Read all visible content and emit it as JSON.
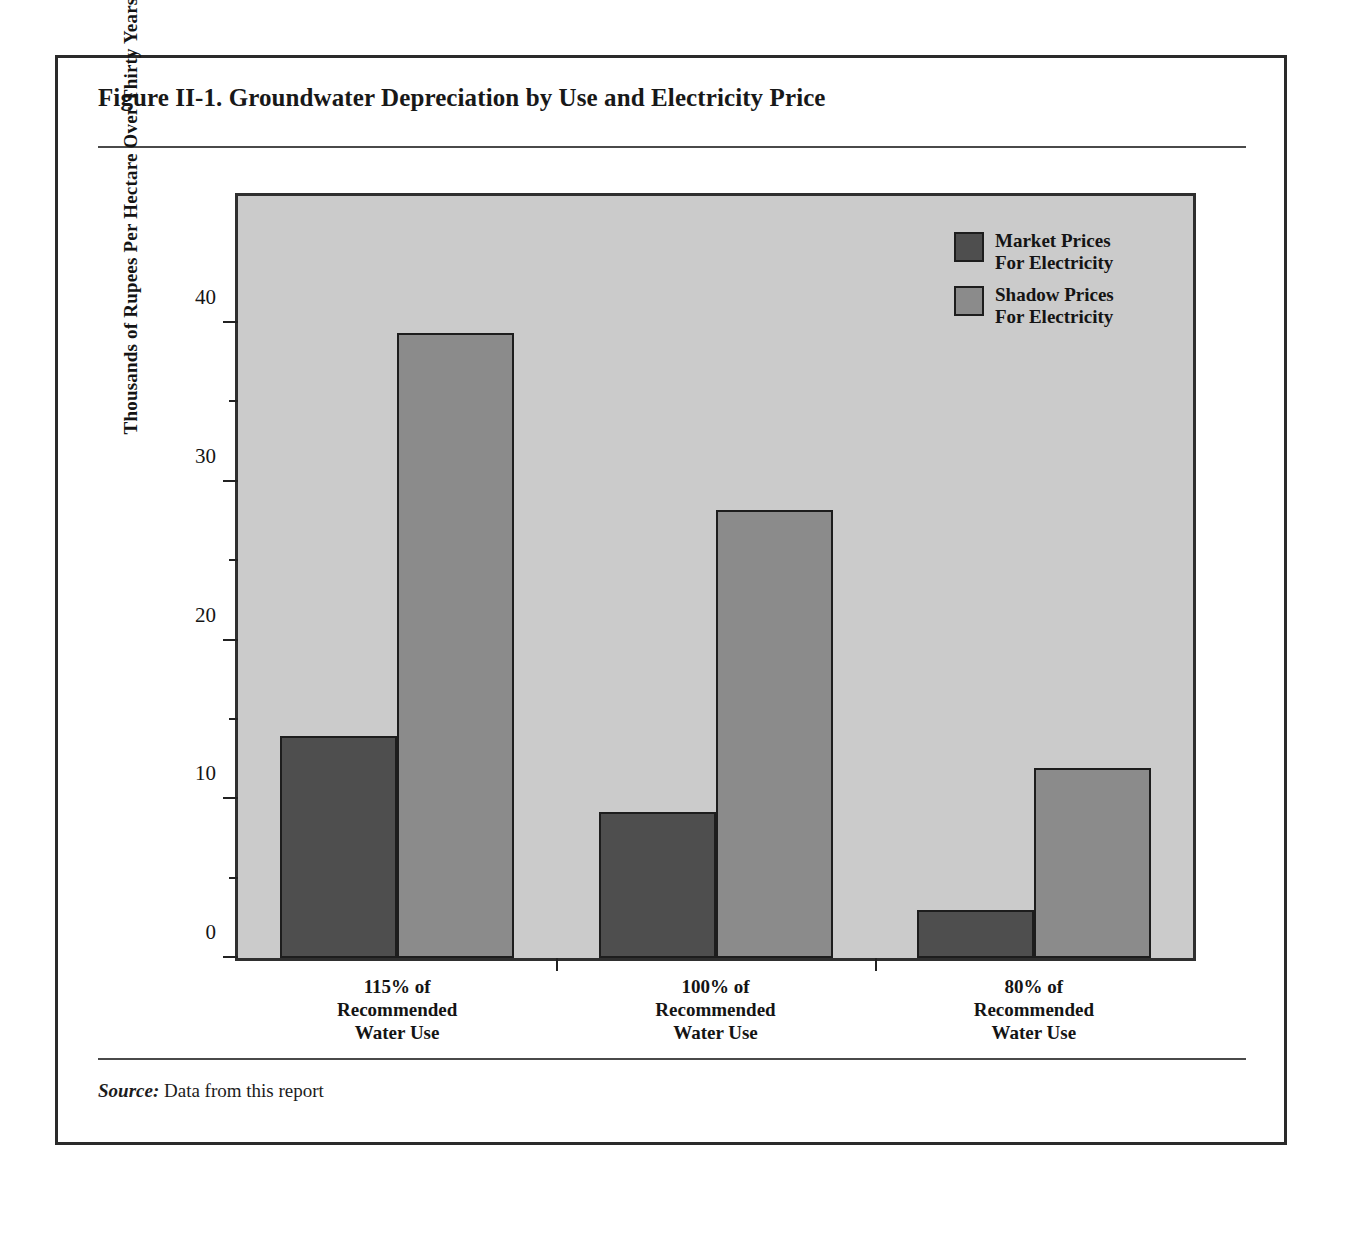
{
  "figure": {
    "title": "Figure II-1.  Groundwater Depreciation by Use and Electricity Price",
    "source_label": "Source:",
    "source_text": " Data from this report"
  },
  "chart_data": {
    "type": "bar",
    "title": "Groundwater Depreciation by Use and Electricity Price",
    "categories": [
      "115% of\nRecommended\nWater Use",
      "100% of\nRecommended\nWater Use",
      "80% of\nRecommended\nWater Use"
    ],
    "category_lines": [
      [
        "115% of",
        "Recommended",
        "Water Use"
      ],
      [
        "100% of",
        "Recommended",
        "Water Use"
      ],
      [
        "80% of",
        "Recommended",
        "Water Use"
      ]
    ],
    "series": [
      {
        "name": "Market Prices For Electricity",
        "name_lines": [
          "Market Prices",
          "For Electricity"
        ],
        "color": "#4e4e4e",
        "values": [
          14.0,
          9.2,
          3.0
        ]
      },
      {
        "name": "Shadow Prices For Electricity",
        "name_lines": [
          "Shadow Prices",
          "For Electricity"
        ],
        "color": "#8b8b8b",
        "values": [
          39.4,
          28.2,
          12.0
        ]
      }
    ],
    "xlabel": "",
    "ylabel": "Thousands of Rupees Per Hectare Over Thirty Years",
    "ylim": [
      0,
      48
    ],
    "ymajor_ticks": [
      0,
      10,
      20,
      30,
      40
    ],
    "yminor_ticks": [
      5,
      15,
      25,
      35
    ],
    "ytick_labels": [
      "0",
      "10",
      "20",
      "30",
      "40"
    ],
    "grid": false,
    "legend_position": "top-right",
    "plot_background": "#cbcbcb"
  }
}
